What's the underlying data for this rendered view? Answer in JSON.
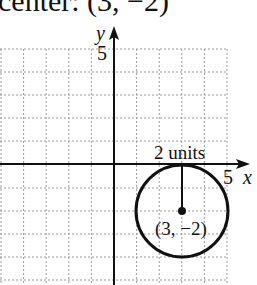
{
  "caption": "center: (3, −2)",
  "graph": {
    "x_axis_label": "x",
    "y_axis_label": "y",
    "x_tick_label": "5",
    "y_tick_label": "5",
    "radius_label": "2 units",
    "center_label": "(3, −2)"
  },
  "circle": {
    "center_x": 3,
    "center_y": -2,
    "radius": 2
  },
  "colors": {
    "ink": "#111111",
    "grid": "#9a9a9a"
  }
}
